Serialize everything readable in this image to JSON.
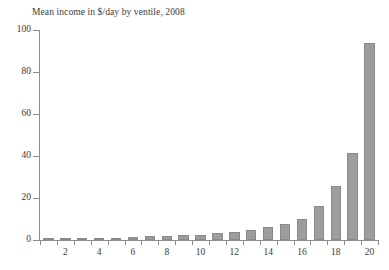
{
  "chart_data": {
    "type": "bar",
    "title": "Mean income in $/day by ventile, 2008",
    "xlabel": "",
    "ylabel": "",
    "categories": [
      1,
      2,
      3,
      4,
      5,
      6,
      7,
      8,
      9,
      10,
      11,
      12,
      13,
      14,
      15,
      16,
      17,
      18,
      19,
      20
    ],
    "values": [
      0.5,
      0.8,
      0.9,
      1.0,
      1.1,
      1.5,
      1.8,
      1.9,
      2.3,
      2.6,
      3.2,
      4.0,
      4.8,
      6.2,
      7.8,
      10.2,
      16.3,
      25.5,
      41.2,
      94.0
    ],
    "xtick_labels": [
      "2",
      "4",
      "6",
      "8",
      "10",
      "12",
      "14",
      "16",
      "18",
      "20"
    ],
    "xtick_values": [
      2,
      4,
      6,
      8,
      10,
      12,
      14,
      16,
      18,
      20
    ],
    "ytick_labels": [
      "0",
      "20",
      "40",
      "60",
      "80",
      "100"
    ],
    "ytick_values": [
      0,
      20,
      40,
      60,
      80,
      100
    ],
    "ylim": [
      0,
      100
    ],
    "xlim": [
      0.5,
      20.5
    ],
    "grid": false,
    "legend": false,
    "bar_color": "#9d9d9d",
    "bar_edge_color": "#8a8a8a",
    "axis_color": "#8c8c8c",
    "text_color": "#3a3a3a",
    "background_color": "#ffffff"
  }
}
